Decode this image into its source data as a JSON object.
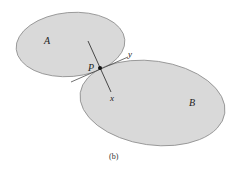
{
  "figure": {
    "caption": "(b)",
    "bodies": [
      {
        "label": "A",
        "fill": "#d9d9d9",
        "stroke": "#8a8a8a"
      },
      {
        "label": "B",
        "fill": "#d9d9d9",
        "stroke": "#8a8a8a"
      }
    ],
    "contact_point": {
      "label": "P"
    },
    "axes": {
      "normal": "x",
      "tangent": "y"
    }
  }
}
